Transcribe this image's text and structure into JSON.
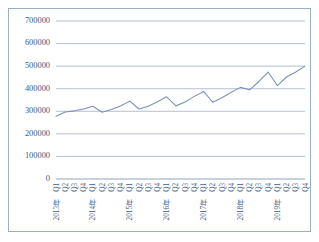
{
  "figure": {
    "caption": "",
    "border_color": "#9aaec9",
    "background": "#ffffff"
  },
  "chart_data": {
    "type": "line",
    "title": "",
    "subtitle": "",
    "xlabel": "",
    "ylabel": "",
    "ylim": [
      0,
      700000
    ],
    "ytick_values": [
      0,
      100000,
      200000,
      300000,
      400000,
      500000,
      600000,
      700000
    ],
    "ytick_labels": [
      "0",
      "100000",
      "200000",
      "300000",
      "400000",
      "500000",
      "600000",
      "700000"
    ],
    "grid": true,
    "grid_axis": "y",
    "legend": false,
    "legend_position": "none",
    "line_color": "#7e93b8",
    "markers": false,
    "categories": [
      "2013年Q1",
      "Q2",
      "Q3",
      "Q4",
      "2014年Q1",
      "Q2",
      "Q3",
      "Q4",
      "2015年Q1",
      "Q2",
      "Q3",
      "Q4",
      "2016年Q1",
      "Q2",
      "Q3",
      "Q4",
      "2017年Q1",
      "Q2",
      "Q3",
      "Q4",
      "2018年Q1",
      "Q2",
      "Q3",
      "Q4",
      "2019年Q1",
      "Q2",
      "Q3",
      "Q4"
    ],
    "quarter_labels": [
      "Q1",
      "Q2",
      "Q3",
      "Q4",
      "Q1",
      "Q2",
      "Q3",
      "Q4",
      "Q1",
      "Q2",
      "Q3",
      "Q4",
      "Q1",
      "Q2",
      "Q3",
      "Q4",
      "Q1",
      "Q2",
      "Q3",
      "Q4",
      "Q1",
      "Q2",
      "Q3",
      "Q4",
      "Q1",
      "Q2",
      "Q3",
      "Q4"
    ],
    "year_labels": [
      {
        "index": 0,
        "label": "2013年"
      },
      {
        "index": 4,
        "label": "2014年"
      },
      {
        "index": 8,
        "label": "2015年"
      },
      {
        "index": 12,
        "label": "2016年"
      },
      {
        "index": 16,
        "label": "2017年"
      },
      {
        "index": 20,
        "label": "2018年"
      },
      {
        "index": 24,
        "label": "2019年"
      }
    ],
    "series": [
      {
        "name": "",
        "values": [
          278000,
          297000,
          302000,
          310000,
          322000,
          296000,
          308000,
          323000,
          345000,
          310000,
          322000,
          342000,
          364000,
          324000,
          341000,
          366000,
          388000,
          340000,
          360000,
          384000,
          406000,
          395000,
          432000,
          474000,
          414000,
          452000,
          474000,
          500000
        ]
      }
    ]
  }
}
